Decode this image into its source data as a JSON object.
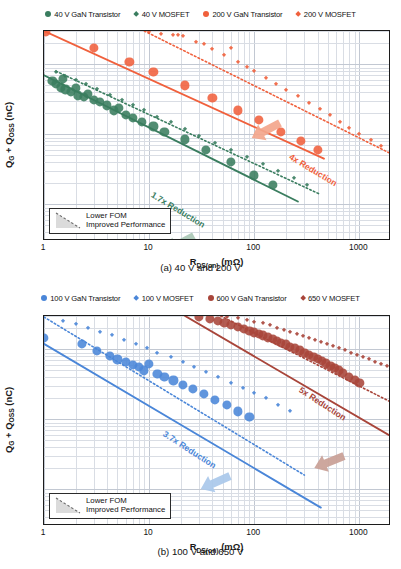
{
  "figure": {
    "panels": [
      {
        "id": "a",
        "caption": "(a) 40 V and 200 V",
        "legend": [
          {
            "label": "40 V GaN Transistor",
            "marker": "circle",
            "color": "#3a7d5f"
          },
          {
            "label": "40 V MOSFET",
            "marker": "diamond",
            "color": "#3a7d5f"
          },
          {
            "label": "200 V GaN Transistor",
            "marker": "circle",
            "color": "#f0603c"
          },
          {
            "label": "200 V MOSFET",
            "marker": "diamond",
            "color": "#f0603c"
          }
        ],
        "annotations": [
          {
            "text": "1.7x Reduction",
            "color": "#3a7d5f"
          },
          {
            "text": "4x Reduction",
            "color": "#f0603c"
          }
        ],
        "inset": {
          "line1": "Lower FOM",
          "line2": "Improved Performance"
        }
      },
      {
        "id": "b",
        "caption": "(b) 100 V and 650 V",
        "legend": [
          {
            "label": "100 V GaN Transistor",
            "marker": "circle",
            "color": "#4a86d8"
          },
          {
            "label": "100 V MOSFET",
            "marker": "diamond",
            "color": "#4a86d8"
          },
          {
            "label": "600 V GaN Transistor",
            "marker": "circle",
            "color": "#a8453a"
          },
          {
            "label": "650 V MOSFET",
            "marker": "diamond",
            "color": "#a8453a"
          }
        ],
        "annotations": [
          {
            "text": "3.7x Reduction",
            "color": "#4a86d8"
          },
          {
            "text": "5x Reduction",
            "color": "#a8453a"
          }
        ],
        "inset": {
          "line1": "Lower FOM",
          "line2": "Improved Performance"
        }
      }
    ]
  },
  "chart_data": [
    {
      "type": "scatter",
      "title": "(a) 40 V and 200 V",
      "xlabel": "R_DS(on) (mΩ)",
      "ylabel": "Q_G + Q_OSS (nC)",
      "xscale": "log",
      "yscale": "log",
      "xlim": [
        1,
        2000
      ],
      "ylim": [
        0.3,
        300
      ],
      "xticks": [
        1,
        10,
        100,
        1000
      ],
      "yticks": [
        0.3,
        3,
        30,
        300
      ],
      "grid": true,
      "legend_position": "above-plot",
      "series": [
        {
          "name": "40 V GaN Transistor",
          "marker": "circle",
          "color": "#3a7d5f",
          "points": [
            [
              1.2,
              58
            ],
            [
              1.3,
              52
            ],
            [
              1.45,
              47
            ],
            [
              1.5,
              62
            ],
            [
              1.6,
              44
            ],
            [
              1.8,
              40
            ],
            [
              2.0,
              46
            ],
            [
              2.1,
              36
            ],
            [
              2.4,
              34
            ],
            [
              2.6,
              38
            ],
            [
              3.0,
              31
            ],
            [
              3.4,
              29
            ],
            [
              4.0,
              26
            ],
            [
              4.6,
              22
            ],
            [
              5.2,
              24
            ],
            [
              6.0,
              19
            ],
            [
              7.0,
              17
            ],
            [
              8.5,
              15
            ],
            [
              11,
              13
            ],
            [
              14,
              11
            ],
            [
              22,
              8.5
            ],
            [
              35,
              6.0
            ],
            [
              60,
              4.0
            ],
            [
              100,
              2.6
            ],
            [
              150,
              1.9
            ]
          ]
        },
        {
          "name": "40 V MOSFET",
          "marker": "diamond",
          "color": "#3a7d5f",
          "points": [
            [
              1.3,
              78
            ],
            [
              1.6,
              68
            ],
            [
              2.0,
              60
            ],
            [
              2.5,
              52
            ],
            [
              3.2,
              44
            ],
            [
              4.2,
              37
            ],
            [
              5.5,
              31
            ],
            [
              7.0,
              26
            ],
            [
              9.0,
              22
            ],
            [
              12,
              18
            ],
            [
              16,
              15
            ],
            [
              22,
              12
            ],
            [
              30,
              9.5
            ],
            [
              42,
              7.6
            ],
            [
              60,
              6.0
            ],
            [
              85,
              4.8
            ],
            [
              120,
              3.8
            ],
            [
              170,
              3.0
            ],
            [
              240,
              2.4
            ],
            [
              320,
              1.9
            ]
          ]
        },
        {
          "name": "200 V GaN Transistor",
          "marker": "circle",
          "color": "#f0603c",
          "points": [
            [
              1.05,
              290
            ],
            [
              3.0,
              170
            ],
            [
              6.5,
              110
            ],
            [
              11,
              78
            ],
            [
              22,
              50
            ],
            [
              40,
              33
            ],
            [
              70,
              22
            ],
            [
              110,
              16
            ],
            [
              180,
              11
            ],
            [
              280,
              8.0
            ],
            [
              400,
              6.0
            ]
          ]
        },
        {
          "name": "200 V MOSFET",
          "marker": "diamond",
          "color": "#f0603c",
          "points": [
            [
              10,
              295
            ],
            [
              13,
              270
            ],
            [
              17,
              265
            ],
            [
              19,
              262
            ],
            [
              21,
              258
            ],
            [
              28,
              210
            ],
            [
              33,
              195
            ],
            [
              40,
              165
            ],
            [
              52,
              135
            ],
            [
              60,
              170
            ],
            [
              70,
              110
            ],
            [
              85,
              92
            ],
            [
              100,
              80
            ],
            [
              130,
              64
            ],
            [
              160,
              52
            ],
            [
              200,
              43
            ],
            [
              260,
              35
            ],
            [
              330,
              28
            ],
            [
              420,
              23
            ],
            [
              520,
              19
            ],
            [
              650,
              15
            ],
            [
              800,
              12.5
            ],
            [
              1000,
              10
            ],
            [
              1300,
              8.2
            ],
            [
              1600,
              6.8
            ]
          ]
        }
      ],
      "trendlines": [
        {
          "name": "40 V GaN fit",
          "color": "#3a7d5f",
          "style": "solid",
          "from": [
            1.0,
            70
          ],
          "to": [
            260,
            1.1
          ]
        },
        {
          "name": "40 V MOSFET fit",
          "color": "#3a7d5f",
          "style": "dotted",
          "from": [
            1.3,
            80
          ],
          "to": [
            420,
            1.4
          ]
        },
        {
          "name": "200 V GaN fit",
          "color": "#f0603c",
          "style": "solid",
          "from": [
            1.0,
            300
          ],
          "to": [
            460,
            4.5
          ]
        },
        {
          "name": "200 V MOSFET fit",
          "color": "#f0603c",
          "style": "dotted",
          "from": [
            9.0,
            300
          ],
          "to": [
            1900,
            5.5
          ]
        }
      ],
      "annotations": [
        {
          "text": "1.7x Reduction",
          "color": "#3a7d5f"
        },
        {
          "text": "4x Reduction",
          "color": "#f0603c"
        },
        {
          "text": "Lower FOM",
          "color": "#111111"
        },
        {
          "text": "Improved Performance",
          "color": "#111111"
        }
      ]
    },
    {
      "type": "scatter",
      "title": "(b) 100 V and 650 V",
      "xlabel": "R_DS(on) (mΩ)",
      "ylabel": "Q_G + Q_OSS (nC)",
      "xscale": "log",
      "yscale": "log",
      "xlim": [
        1,
        2000
      ],
      "ylim": [
        0.3,
        300
      ],
      "xticks": [
        1,
        10,
        100,
        1000
      ],
      "yticks": [
        0.3,
        3,
        30,
        300
      ],
      "grid": true,
      "legend_position": "above-plot",
      "series": [
        {
          "name": "100 V GaN Transistor",
          "marker": "circle",
          "color": "#4a86d8",
          "points": [
            [
              1.0,
              145
            ],
            [
              2.3,
              120
            ],
            [
              3.2,
              95
            ],
            [
              4.2,
              80
            ],
            [
              5.0,
              72
            ],
            [
              6.0,
              66
            ],
            [
              7.0,
              60
            ],
            [
              8.0,
              56
            ],
            [
              9.0,
              50
            ],
            [
              10,
              62
            ],
            [
              12,
              45
            ],
            [
              14,
              40
            ],
            [
              17,
              36
            ],
            [
              21,
              31
            ],
            [
              26,
              27
            ],
            [
              33,
              23
            ],
            [
              42,
              19
            ],
            [
              55,
              16
            ],
            [
              70,
              13
            ],
            [
              90,
              11
            ]
          ]
        },
        {
          "name": "100 V MOSFET",
          "marker": "diamond",
          "color": "#4a86d8",
          "points": [
            [
              1.5,
              255
            ],
            [
              2.0,
              230
            ],
            [
              2.6,
              205
            ],
            [
              3.4,
              180
            ],
            [
              4.4,
              158
            ],
            [
              5.8,
              138
            ],
            [
              7.5,
              120
            ],
            [
              9.5,
              104
            ],
            [
              12,
              90
            ],
            [
              16,
              77
            ],
            [
              21,
              66
            ],
            [
              27,
              56
            ],
            [
              35,
              47
            ],
            [
              45,
              40
            ],
            [
              60,
              33
            ],
            [
              78,
              28
            ],
            [
              100,
              24
            ],
            [
              130,
              20
            ],
            [
              170,
              16
            ],
            [
              220,
              13
            ]
          ]
        },
        {
          "name": "600 V GaN Transistor",
          "marker": "circle",
          "color": "#a8453a",
          "points": [
            [
              30,
              290
            ],
            [
              38,
              270
            ],
            [
              45,
              255
            ],
            [
              52,
              240
            ],
            [
              60,
              225
            ],
            [
              70,
              210
            ],
            [
              80,
              195
            ],
            [
              90,
              185
            ],
            [
              100,
              175
            ],
            [
              110,
              165
            ],
            [
              120,
              158
            ],
            [
              135,
              148
            ],
            [
              150,
              140
            ],
            [
              165,
              132
            ],
            [
              180,
              125
            ],
            [
              200,
              118
            ],
            [
              220,
              110
            ],
            [
              245,
              103
            ],
            [
              270,
              97
            ],
            [
              300,
              90
            ],
            [
              330,
              84
            ],
            [
              365,
              78
            ],
            [
              400,
              73
            ],
            [
              440,
              68
            ],
            [
              480,
              63
            ],
            [
              530,
              58
            ],
            [
              580,
              54
            ],
            [
              640,
              50
            ],
            [
              700,
              46
            ],
            [
              800,
              41
            ],
            [
              900,
              37
            ],
            [
              1000,
              33
            ]
          ]
        },
        {
          "name": "650 V MOSFET",
          "marker": "diamond",
          "color": "#a8453a",
          "points": [
            [
              55,
              295
            ],
            [
              70,
              280
            ],
            [
              85,
              265
            ],
            [
              100,
              250
            ],
            [
              120,
              235
            ],
            [
              140,
              220
            ],
            [
              165,
              205
            ],
            [
              190,
              192
            ],
            [
              220,
              180
            ],
            [
              255,
              168
            ],
            [
              290,
              157
            ],
            [
              330,
              147
            ],
            [
              380,
              137
            ],
            [
              430,
              128
            ],
            [
              490,
              120
            ],
            [
              560,
              112
            ],
            [
              640,
              104
            ],
            [
              730,
              97
            ],
            [
              830,
              90
            ],
            [
              950,
              84
            ],
            [
              1080,
              78
            ],
            [
              1230,
              72
            ],
            [
              1400,
              67
            ],
            [
              1600,
              62
            ],
            [
              1850,
              57
            ]
          ]
        }
      ],
      "trendlines": [
        {
          "name": "100 V GaN fit",
          "color": "#4a86d8",
          "style": "solid",
          "from": [
            1.0,
            120
          ],
          "to": [
            430,
            0.55
          ]
        },
        {
          "name": "100 V MOSFET fit",
          "color": "#4a86d8",
          "style": "dotted",
          "from": [
            1.0,
            290
          ],
          "to": [
            300,
            1.6
          ]
        },
        {
          "name": "600 V GaN fit",
          "color": "#a8453a",
          "style": "solid",
          "from": [
            22,
            300
          ],
          "to": [
            1900,
            6.0
          ]
        },
        {
          "name": "650 V MOSFET fit",
          "color": "#a8453a",
          "style": "dotted",
          "from": [
            48,
            300
          ],
          "to": [
            1950,
            18
          ]
        }
      ],
      "annotations": [
        {
          "text": "3.7x Reduction",
          "color": "#4a86d8"
        },
        {
          "text": "5x Reduction",
          "color": "#a8453a"
        },
        {
          "text": "Lower FOM",
          "color": "#111111"
        },
        {
          "text": "Improved Performance",
          "color": "#111111"
        }
      ]
    }
  ]
}
